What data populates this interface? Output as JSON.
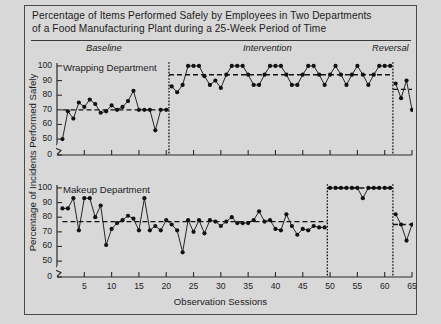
{
  "figure": {
    "title": "Percentage of Items Performed Safely by Employees in Two Departments of a Food Manufacturing Plant during a 25-Week Period of Time",
    "title_line1": "Percentage of Items Performed Safely by Employees in Two Departments",
    "title_line2": "of a Food Manufacturing Plant during a 25-Week Period of Time",
    "ylabel": "Percentage of Incidents Performed Safely",
    "xlabel": "Observation Sessions",
    "phase_labels": {
      "baseline": "Baseline",
      "intervention": "Intervention",
      "reversal": "Reversal"
    },
    "panel_labels": {
      "top": "Wrapping Department",
      "bottom": "Makeup Department"
    },
    "colors": {
      "background": "#d8d8d8",
      "ink": "#1c1c1c",
      "marker": "#111111",
      "axis": "#2b2b2b"
    }
  },
  "chart_data": [
    {
      "type": "line",
      "title": "Wrapping Department",
      "xlabel": "Observation Sessions",
      "ylabel": "Percentage of Incidents Performed Safely",
      "xlim": [
        0,
        65
      ],
      "ylim": [
        45,
        102
      ],
      "yticks": [
        0,
        50,
        60,
        70,
        80,
        90,
        100
      ],
      "axis_break": true,
      "grid": false,
      "legend_position": "none",
      "phases": [
        {
          "name": "Baseline",
          "x_start": 1,
          "x_end": 20,
          "mean": 70
        },
        {
          "name": "Intervention",
          "x_start": 21,
          "x_end": 61,
          "mean": 94
        },
        {
          "name": "Reversal",
          "x_start": 62,
          "x_end": 65,
          "mean": 84
        }
      ],
      "phase_line_x": [
        20.5,
        61.5
      ],
      "mean_lines": [
        {
          "phase": "Baseline",
          "value": 70,
          "x_start": 1,
          "x_end": 20.5
        },
        {
          "phase": "Intervention",
          "value": 94,
          "x_start": 20.5,
          "x_end": 61.5
        },
        {
          "phase": "Reversal",
          "value": 84,
          "x_start": 61.5,
          "x_end": 65
        }
      ],
      "series": [
        {
          "name": "Wrapping Department",
          "x": [
            1,
            2,
            3,
            4,
            5,
            6,
            7,
            8,
            9,
            10,
            11,
            12,
            13,
            14,
            15,
            16,
            17,
            18,
            19,
            20,
            21,
            22,
            23,
            24,
            25,
            26,
            27,
            28,
            29,
            30,
            31,
            32,
            33,
            34,
            35,
            36,
            37,
            38,
            39,
            40,
            41,
            42,
            43,
            44,
            45,
            46,
            47,
            48,
            49,
            50,
            51,
            52,
            53,
            54,
            55,
            56,
            57,
            58,
            59,
            60,
            61,
            62,
            63,
            64,
            65
          ],
          "values": [
            50,
            69,
            64,
            75,
            72,
            77,
            74,
            68,
            69,
            73,
            70,
            72,
            76,
            83,
            70,
            70,
            70,
            56,
            70,
            70,
            86,
            82,
            87,
            100,
            100,
            100,
            93,
            87,
            90,
            85,
            94,
            100,
            100,
            100,
            94,
            87,
            87,
            94,
            100,
            100,
            100,
            94,
            87,
            87,
            94,
            100,
            100,
            94,
            87,
            94,
            100,
            94,
            87,
            94,
            100,
            94,
            87,
            94,
            100,
            100,
            100,
            88,
            78,
            90,
            70
          ]
        }
      ]
    },
    {
      "type": "line",
      "title": "Makeup Department",
      "xlabel": "Observation Sessions",
      "ylabel": "Percentage of Incidents Performed Safely",
      "xlim": [
        0,
        65
      ],
      "ylim": [
        45,
        102
      ],
      "yticks": [
        0,
        50,
        60,
        70,
        80,
        90,
        100
      ],
      "axis_break": true,
      "grid": false,
      "legend_position": "none",
      "phases": [
        {
          "name": "Baseline",
          "x_start": 1,
          "x_end": 49,
          "mean": 77
        },
        {
          "name": "Intervention",
          "x_start": 50,
          "x_end": 61,
          "mean": 100
        },
        {
          "name": "Reversal",
          "x_start": 62,
          "x_end": 65,
          "mean": 75
        }
      ],
      "phase_line_x": [
        49.5,
        61.5
      ],
      "mean_lines": [
        {
          "phase": "Baseline",
          "value": 77,
          "x_start": 1,
          "x_end": 49.5
        },
        {
          "phase": "Intervention",
          "value": 100,
          "x_start": 49.5,
          "x_end": 61.5
        },
        {
          "phase": "Reversal",
          "value": 75,
          "x_start": 61.5,
          "x_end": 65
        }
      ],
      "series": [
        {
          "name": "Makeup Department",
          "x": [
            1,
            2,
            3,
            4,
            5,
            6,
            7,
            8,
            9,
            10,
            11,
            12,
            13,
            14,
            15,
            16,
            17,
            18,
            19,
            20,
            21,
            22,
            23,
            24,
            25,
            26,
            27,
            28,
            29,
            30,
            31,
            32,
            33,
            34,
            35,
            36,
            37,
            38,
            39,
            40,
            41,
            42,
            43,
            44,
            45,
            46,
            47,
            48,
            49,
            50,
            51,
            52,
            53,
            54,
            55,
            56,
            57,
            58,
            59,
            60,
            61,
            62,
            63,
            64,
            65
          ],
          "values": [
            86,
            86,
            93,
            71,
            93,
            93,
            80,
            88,
            61,
            72,
            76,
            78,
            81,
            79,
            71,
            93,
            71,
            74,
            71,
            78,
            75,
            71,
            56,
            78,
            70,
            78,
            69,
            78,
            77,
            74,
            77,
            80,
            76,
            76,
            76,
            78,
            84,
            77,
            78,
            72,
            71,
            82,
            74,
            68,
            72,
            71,
            74,
            73,
            73,
            100,
            100,
            100,
            100,
            100,
            100,
            93,
            100,
            100,
            100,
            100,
            100,
            82,
            75,
            64,
            75
          ]
        }
      ]
    }
  ],
  "axes": {
    "xticks": [
      5,
      10,
      15,
      20,
      25,
      30,
      35,
      40,
      45,
      50,
      55,
      60,
      65
    ],
    "xtick_labels": [
      "5",
      "10",
      "15",
      "20",
      "25",
      "30",
      "35",
      "40",
      "45",
      "50",
      "55",
      "60",
      "65"
    ],
    "ytick_labels": [
      "100",
      "90",
      "80",
      "70",
      "60",
      "50",
      "0"
    ]
  }
}
